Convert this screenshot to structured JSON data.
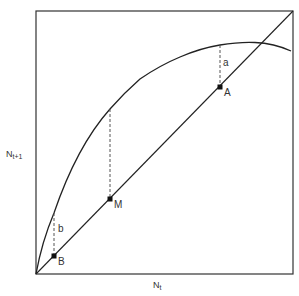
{
  "diagram": {
    "type": "ricker-recruitment-curve",
    "axes": {
      "x_label": "N",
      "x_label_sub": "t",
      "y_label": "N",
      "y_label_sub": "t+1"
    },
    "points": [
      {
        "id": "B",
        "label": "B"
      },
      {
        "id": "M",
        "label": "M"
      },
      {
        "id": "A",
        "label": "A"
      }
    ],
    "gaps": [
      {
        "id": "a",
        "label": "a"
      },
      {
        "id": "b",
        "label": "b"
      }
    ],
    "elements": {
      "curve": "recruitment curve",
      "diagonal": "replacement line (N t+1 = N t)"
    },
    "colors": {
      "stroke": "#222222",
      "dashed": "#555555",
      "background": "#ffffff"
    }
  }
}
